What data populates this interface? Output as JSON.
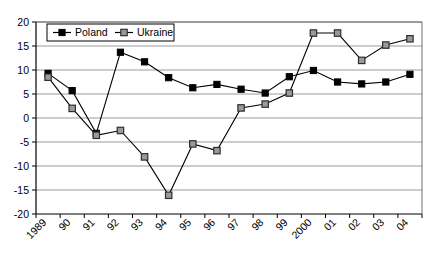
{
  "chart_data": {
    "type": "line",
    "title": "",
    "xlabel": "",
    "ylabel": "",
    "ylim": [
      -20,
      20
    ],
    "ytick_step": 5,
    "grid": true,
    "legend_position": "top-left",
    "categories": [
      "1989",
      "90",
      "91",
      "92",
      "93",
      "94",
      "95",
      "96",
      "97",
      "98",
      "99",
      "2000",
      "01",
      "02",
      "03",
      "04"
    ],
    "yticks": [
      "20",
      "15",
      "10",
      "5",
      "0",
      "-5",
      "-10",
      "-15",
      "-20"
    ],
    "series": [
      {
        "name": "Poland",
        "marker": "filled-square",
        "color": "#000000",
        "marker_fill": "#000000",
        "values": [
          9.3,
          5.7,
          -3.2,
          13.7,
          11.7,
          8.4,
          6.3,
          7.0,
          6.0,
          5.2,
          8.6,
          9.9,
          7.5,
          7.1,
          7.5,
          9.1
        ]
      },
      {
        "name": "Ukraine",
        "marker": "open-square",
        "color": "#3a3a3a",
        "marker_fill": "#9a9a9a",
        "values": [
          8.5,
          2.0,
          -3.6,
          -2.6,
          -8.1,
          -16.1,
          -5.4,
          -6.8,
          2.1,
          2.9,
          5.2,
          17.7,
          17.7,
          12.0,
          15.2,
          16.5
        ]
      }
    ]
  },
  "legend": {
    "items": [
      {
        "label": "Poland"
      },
      {
        "label": "Ukraine"
      }
    ]
  },
  "icons": {
    "poland_marker": "filled-square-marker-icon",
    "ukraine_marker": "open-square-marker-icon"
  }
}
